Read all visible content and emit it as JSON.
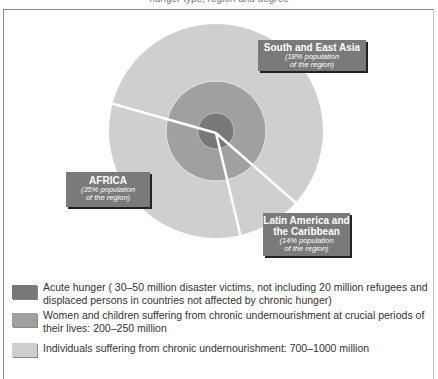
{
  "title": "hunger type, region and degree",
  "colors": {
    "acute": "#787878",
    "women_children": "#a0a0a0",
    "chronic": "#cfcfcf",
    "label_box": "#7a7a7a",
    "divider": "#ffffff"
  },
  "diagram": {
    "center": [
      216,
      131
    ],
    "rings": [
      {
        "name": "chronic",
        "radius": 107
      },
      {
        "name": "women_children",
        "radius": 50
      },
      {
        "name": "acute",
        "radius": 18
      }
    ],
    "divider_endpoints": [
      [
        110,
        103
      ],
      [
        296,
        203
      ],
      [
        241,
        238
      ]
    ]
  },
  "regions": [
    {
      "name": "South and East Asia",
      "pct": "(18% population",
      "pct2": "of the region)"
    },
    {
      "name": "AFRICA",
      "pct": "(35% population",
      "pct2": "of the region)"
    },
    {
      "name": "Latin America and",
      "name2": "the Caribbean",
      "pct": "(14% population",
      "pct2": "of the region)"
    }
  ],
  "legend": [
    {
      "label": "Acute hunger ( 30–50 million disaster victims, not including 20 million refugees and displaced persons in countries not affected by chronic hunger)"
    },
    {
      "label": "Women and children suffering from chronic undernourishment at crucial periods of their lives: 200–250 million"
    },
    {
      "label": "Individuals suffering from chronic undernourishment: 700–1000 million"
    }
  ]
}
